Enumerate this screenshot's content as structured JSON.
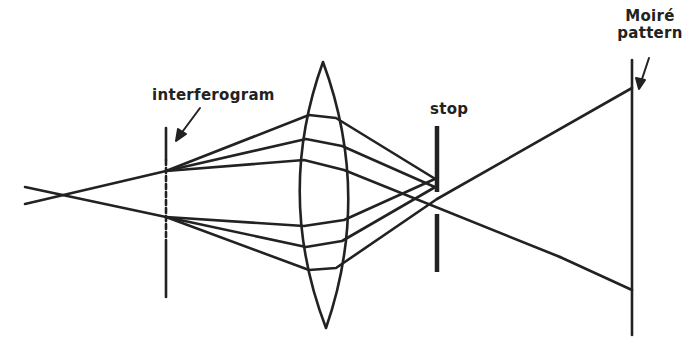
{
  "diagram": {
    "type": "optical-ray-diagram",
    "labels": {
      "interferogram": "interferogram",
      "stop": "stop",
      "moire_line1": "Moiré",
      "moire_line2": "pattern"
    },
    "colors": {
      "background": "#ffffff",
      "ink": "#222222"
    },
    "elements": [
      {
        "name": "source-crossing",
        "x": 63,
        "y": 195
      },
      {
        "name": "interferogram-plane",
        "x": 166,
        "y_top": 128,
        "y_bottom": 297,
        "style": "dashed"
      },
      {
        "name": "lens",
        "x_center": 324,
        "y_top": 62,
        "y_bottom": 328
      },
      {
        "name": "stop",
        "x": 437,
        "upper_segment": [
          126,
          192
        ],
        "lower_segment": [
          214,
          272
        ]
      },
      {
        "name": "moire-screen",
        "x": 632,
        "y_top": 60,
        "y_bottom": 335
      }
    ]
  }
}
